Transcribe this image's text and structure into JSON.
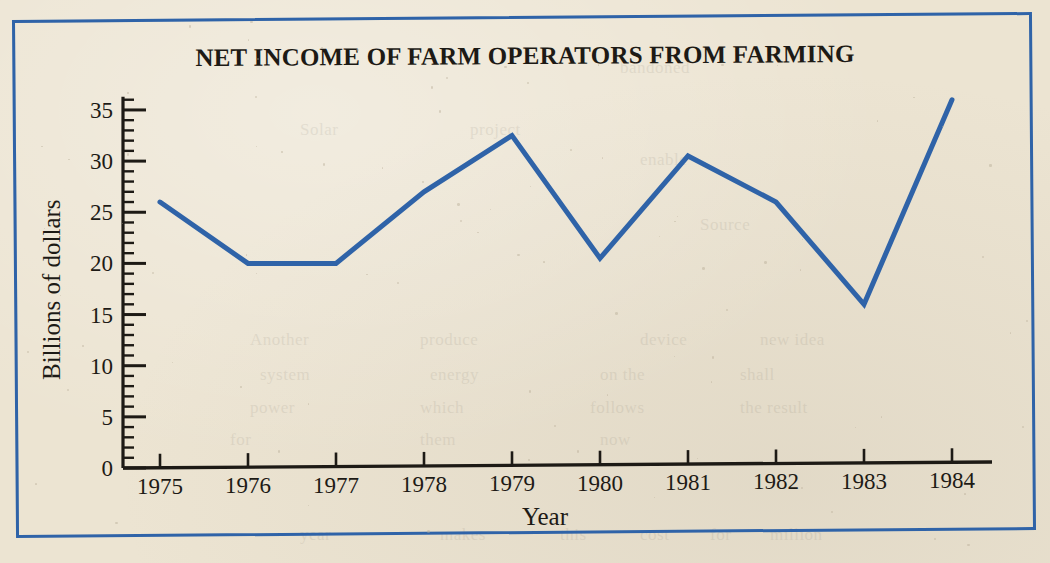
{
  "figure": {
    "title": "NET INCOME OF FARM OPERATORS FROM FARMING",
    "border_color": "#2f63a8",
    "line_color": "#2f63a8",
    "paper_color": "#ece4d2",
    "ink_color": "#1d1a15"
  },
  "chart_data": {
    "type": "line",
    "title": "NET INCOME OF FARM OPERATORS FROM FARMING",
    "xlabel": "Year",
    "ylabel": "Billions of dollars",
    "categories": [
      "1975",
      "1976",
      "1977",
      "1978",
      "1979",
      "1980",
      "1981",
      "1982",
      "1983",
      "1984"
    ],
    "x": [
      1975,
      1976,
      1977,
      1978,
      1979,
      1980,
      1981,
      1982,
      1983,
      1984
    ],
    "values": [
      26,
      20,
      20,
      27,
      32.5,
      20.5,
      30.5,
      26,
      16,
      36
    ],
    "series": [
      {
        "name": "Net income of farm operators from farming",
        "values": [
          26,
          20,
          20,
          27,
          32.5,
          20.5,
          30.5,
          26,
          16,
          36
        ]
      }
    ],
    "ylim": [
      0,
      36.5
    ],
    "xlim": [
      1974.6,
      1984.6
    ],
    "yticks": [
      0,
      5,
      10,
      15,
      20,
      25,
      30,
      35
    ],
    "ytick_labels": [
      "0",
      "5",
      "10",
      "15",
      "20",
      "25",
      "30",
      "35"
    ],
    "y_minor_tick_step": 1,
    "xticks": [
      1975,
      1976,
      1977,
      1978,
      1979,
      1980,
      1981,
      1982,
      1983,
      1984
    ],
    "xtick_labels": [
      "1975",
      "1976",
      "1977",
      "1978",
      "1979",
      "1980",
      "1981",
      "1982",
      "1983",
      "1984"
    ],
    "grid": false,
    "legend": false,
    "legend_position": "none",
    "markers": false,
    "line_width": 5,
    "line_color": "#2f63a8",
    "annotations": []
  },
  "ghost_text": [
    {
      "text": "bandoned",
      "x": 620,
      "y": 58
    },
    {
      "text": "Solar",
      "x": 300,
      "y": 120
    },
    {
      "text": "project",
      "x": 470,
      "y": 120
    },
    {
      "text": "enable",
      "x": 640,
      "y": 150
    },
    {
      "text": "Source",
      "x": 700,
      "y": 215
    },
    {
      "text": "Another",
      "x": 250,
      "y": 330
    },
    {
      "text": "produce",
      "x": 420,
      "y": 330
    },
    {
      "text": "device",
      "x": 640,
      "y": 330
    },
    {
      "text": "new idea",
      "x": 760,
      "y": 330
    },
    {
      "text": "system",
      "x": 260,
      "y": 365
    },
    {
      "text": "energy",
      "x": 430,
      "y": 365
    },
    {
      "text": "on the",
      "x": 600,
      "y": 365
    },
    {
      "text": "shall",
      "x": 740,
      "y": 365
    },
    {
      "text": "power",
      "x": 250,
      "y": 398
    },
    {
      "text": "which",
      "x": 420,
      "y": 398
    },
    {
      "text": "follows",
      "x": 590,
      "y": 398
    },
    {
      "text": "the result",
      "x": 740,
      "y": 398
    },
    {
      "text": "for",
      "x": 230,
      "y": 430
    },
    {
      "text": "them",
      "x": 420,
      "y": 430
    },
    {
      "text": "now",
      "x": 600,
      "y": 430
    },
    {
      "text": "year",
      "x": 300,
      "y": 525
    },
    {
      "text": "makes",
      "x": 440,
      "y": 525
    },
    {
      "text": "this",
      "x": 560,
      "y": 525
    },
    {
      "text": "cost",
      "x": 640,
      "y": 525
    },
    {
      "text": "for",
      "x": 710,
      "y": 525
    },
    {
      "text": "million",
      "x": 770,
      "y": 525
    }
  ]
}
